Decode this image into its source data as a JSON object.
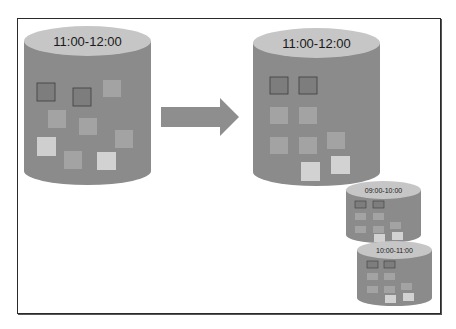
{
  "diagram": {
    "type": "time-partition-split",
    "colors": {
      "cylinder_body": "#8b8b8b",
      "cylinder_top": "#c6c6c6",
      "arrow": "#8e8e8e",
      "frame_border": "#2a2a2a",
      "square_dark": "#7d7d7d",
      "square_mid": "#a3a3a3",
      "square_light": "#cfcfcf",
      "square_border": "#3c3c3c"
    },
    "source_cylinder": {
      "label": "11:00-12:00"
    },
    "arrow": {
      "direction": "right"
    },
    "result_cylinders": [
      {
        "label": "11:00-12:00"
      },
      {
        "label": "09:00-10:00"
      },
      {
        "label": "10:00-11:00"
      }
    ]
  }
}
